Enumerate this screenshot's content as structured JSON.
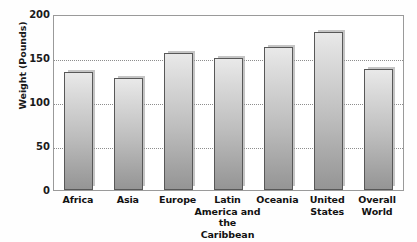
{
  "chart_data": {
    "type": "bar",
    "title": "",
    "xlabel": "",
    "ylabel": "Weight (Pounds)",
    "ylim": [
      0,
      200
    ],
    "yticks": [
      0,
      50,
      100,
      150,
      200
    ],
    "ytick_labels": [
      "0",
      "50",
      "100",
      "150",
      "200"
    ],
    "grid": true,
    "gridlines_at": [
      50,
      100,
      150
    ],
    "legend": "none",
    "categories": [
      "Africa",
      "Asia",
      "Europe",
      "Latin America and the Caribbean",
      "Oceania",
      "United States",
      "Overall World"
    ],
    "category_label_lines": [
      [
        "Africa"
      ],
      [
        "Asia"
      ],
      [
        "Europe"
      ],
      [
        "Latin",
        "America and",
        "the Caribbean"
      ],
      [
        "Oceania"
      ],
      [
        "United",
        "States"
      ],
      [
        "Overall",
        "World"
      ]
    ],
    "values": [
      134,
      127,
      156,
      150,
      163,
      180,
      137
    ],
    "bars": [
      {
        "category": "Africa",
        "value": 134
      },
      {
        "category": "Asia",
        "value": 127
      },
      {
        "category": "Europe",
        "value": 156
      },
      {
        "category": "Latin America and the Caribbean",
        "value": 150
      },
      {
        "category": "Oceania",
        "value": 163
      },
      {
        "category": "United States",
        "value": 180
      },
      {
        "category": "Overall World",
        "value": 137
      }
    ],
    "colors": {
      "bar_top": "#e9e9e9",
      "bar_bottom": "#959595",
      "bar_border": "#585858",
      "bar_shadow": "#969696",
      "gridline": "#8d8d8d",
      "frame": "#9a9a9a",
      "text": "#121212",
      "background": "#ffffff"
    }
  }
}
